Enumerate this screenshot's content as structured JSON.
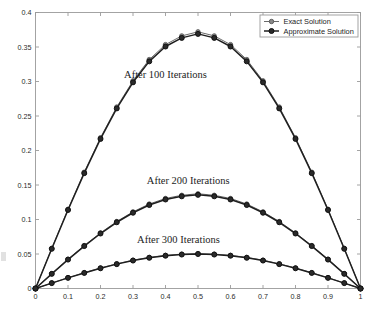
{
  "figure": {
    "background_color": "#ffffff",
    "axis_color": "#9a9a9a",
    "text_color": "#2b2b2b"
  },
  "axes": {
    "x_ticks": [
      "0",
      "0.1",
      "0.2",
      "0.3",
      "0.4",
      "0.5",
      "0.6",
      "0.7",
      "0.8",
      "0.9",
      "1"
    ],
    "y_ticks": [
      "0",
      "0.05",
      "0.1",
      "0.15",
      "0.2",
      "0.25",
      "0.3",
      "0.35",
      "0.4"
    ],
    "xlim": [
      0,
      1
    ],
    "ylim": [
      0,
      0.4
    ]
  },
  "legend": {
    "position": "top-right",
    "entries": [
      {
        "label": "Exact Solution",
        "color": "#6b6b6b",
        "marker": "circle",
        "linewidth": 1.0
      },
      {
        "label": "Approximate Solution",
        "color": "#1f1f1f",
        "marker": "circle",
        "linewidth": 1.6
      }
    ]
  },
  "annotations": [
    {
      "text": "After 100 Iterations",
      "x": 0.4,
      "y": 0.305
    },
    {
      "text": "After 200 Iterations",
      "x": 0.47,
      "y": 0.152
    },
    {
      "text": "After 300 Iterations",
      "x": 0.44,
      "y": 0.066
    }
  ],
  "chart_data": {
    "type": "line",
    "title": "",
    "xlabel": "",
    "ylabel": "",
    "xlim": [
      0,
      1
    ],
    "ylim": [
      0,
      0.4
    ],
    "grid": false,
    "legend_position": "top-right",
    "x": [
      0,
      0.05,
      0.1,
      0.15,
      0.2,
      0.25,
      0.3,
      0.35,
      0.4,
      0.45,
      0.5,
      0.55,
      0.6,
      0.65,
      0.7,
      0.75,
      0.8,
      0.85,
      0.9,
      0.95,
      1
    ],
    "series": [
      {
        "name": "Exact Solution",
        "iterations": 100,
        "color": "#6b6b6b",
        "values": [
          0,
          0.0582,
          0.1149,
          0.1686,
          0.2185,
          0.263,
          0.301,
          0.3318,
          0.3535,
          0.3661,
          0.372,
          0.3661,
          0.3535,
          0.3318,
          0.301,
          0.263,
          0.2185,
          0.1686,
          0.1149,
          0.0582,
          0
        ]
      },
      {
        "name": "Approximate Solution",
        "iterations": 100,
        "color": "#1f1f1f",
        "values": [
          0,
          0.0575,
          0.1138,
          0.1672,
          0.2168,
          0.261,
          0.2988,
          0.3292,
          0.3507,
          0.3632,
          0.369,
          0.3632,
          0.3507,
          0.3292,
          0.2988,
          0.261,
          0.2168,
          0.1672,
          0.1138,
          0.0575,
          0
        ]
      },
      {
        "name": "Exact Solution",
        "iterations": 200,
        "color": "#6b6b6b",
        "values": [
          0,
          0.0215,
          0.0424,
          0.0622,
          0.0806,
          0.0971,
          0.1111,
          0.1224,
          0.1305,
          0.1351,
          0.1373,
          0.1351,
          0.1305,
          0.1224,
          0.1111,
          0.0971,
          0.0806,
          0.0622,
          0.0424,
          0.0215,
          0
        ]
      },
      {
        "name": "Approximate Solution",
        "iterations": 200,
        "color": "#1f1f1f",
        "values": [
          0,
          0.0212,
          0.0419,
          0.0615,
          0.0797,
          0.096,
          0.1098,
          0.121,
          0.129,
          0.1336,
          0.1357,
          0.1336,
          0.129,
          0.121,
          0.1098,
          0.096,
          0.0797,
          0.0615,
          0.0419,
          0.0212,
          0
        ]
      },
      {
        "name": "Exact Solution",
        "iterations": 300,
        "color": "#6b6b6b",
        "values": [
          0,
          0.0079,
          0.0156,
          0.0229,
          0.0297,
          0.0358,
          0.041,
          0.0451,
          0.0481,
          0.0498,
          0.0506,
          0.0498,
          0.0481,
          0.0451,
          0.041,
          0.0358,
          0.0297,
          0.0229,
          0.0156,
          0.0079,
          0
        ]
      },
      {
        "name": "Approximate Solution",
        "iterations": 300,
        "color": "#1f1f1f",
        "values": [
          0,
          0.0078,
          0.0154,
          0.0226,
          0.0293,
          0.0353,
          0.0405,
          0.0445,
          0.0475,
          0.0492,
          0.05,
          0.0492,
          0.0475,
          0.0445,
          0.0405,
          0.0353,
          0.0293,
          0.0226,
          0.0154,
          0.0078,
          0
        ]
      }
    ]
  }
}
